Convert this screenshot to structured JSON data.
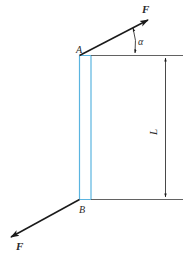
{
  "figure": {
    "labels": {
      "point_top": "A",
      "point_bottom": "B",
      "force_top": "F",
      "force_bottom": "F",
      "angle": "α",
      "length": "L"
    },
    "colors": {
      "beam": "#5ab4e0",
      "lines": "#3a3a3a",
      "force": "#1a1a1a",
      "background": "#ffffff"
    }
  }
}
